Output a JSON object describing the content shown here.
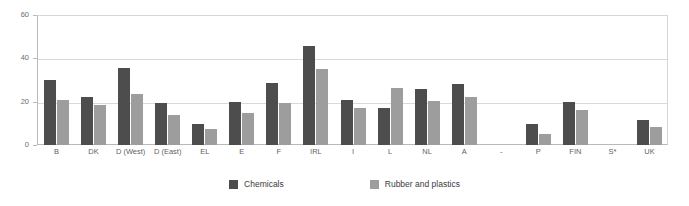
{
  "chart_data": {
    "type": "bar",
    "title": "",
    "subtitle": "",
    "xlabel": "",
    "ylabel": "",
    "ylim": [
      0,
      60
    ],
    "yticks": [
      0,
      20,
      40,
      60
    ],
    "grid": true,
    "legend_position": "bottom",
    "categories": [
      "B",
      "DK",
      "D (West)",
      "D (East)",
      "EL",
      "E",
      "F",
      "IRL",
      "I",
      "L",
      "NL",
      "A",
      "-",
      "P",
      "FIN",
      "S*",
      "UK"
    ],
    "series": [
      {
        "name": "Chemicals",
        "color": "#4d4d4d",
        "values": [
          30,
          22,
          35.5,
          19.5,
          9.5,
          20,
          28.5,
          45.5,
          21,
          17,
          26,
          28,
          null,
          9.5,
          20,
          null,
          11.5
        ]
      },
      {
        "name": "Rubber and plastics",
        "color": "#9d9d9d",
        "values": [
          21,
          18.5,
          23.5,
          14,
          7.5,
          15,
          19.5,
          35,
          17,
          26.5,
          20.5,
          22,
          null,
          5,
          16,
          null,
          8.5
        ]
      }
    ]
  },
  "legend": {
    "items": [
      {
        "label": "Chemicals",
        "swatch": "dark"
      },
      {
        "label": "Rubber and plastics",
        "swatch": "light"
      }
    ]
  }
}
